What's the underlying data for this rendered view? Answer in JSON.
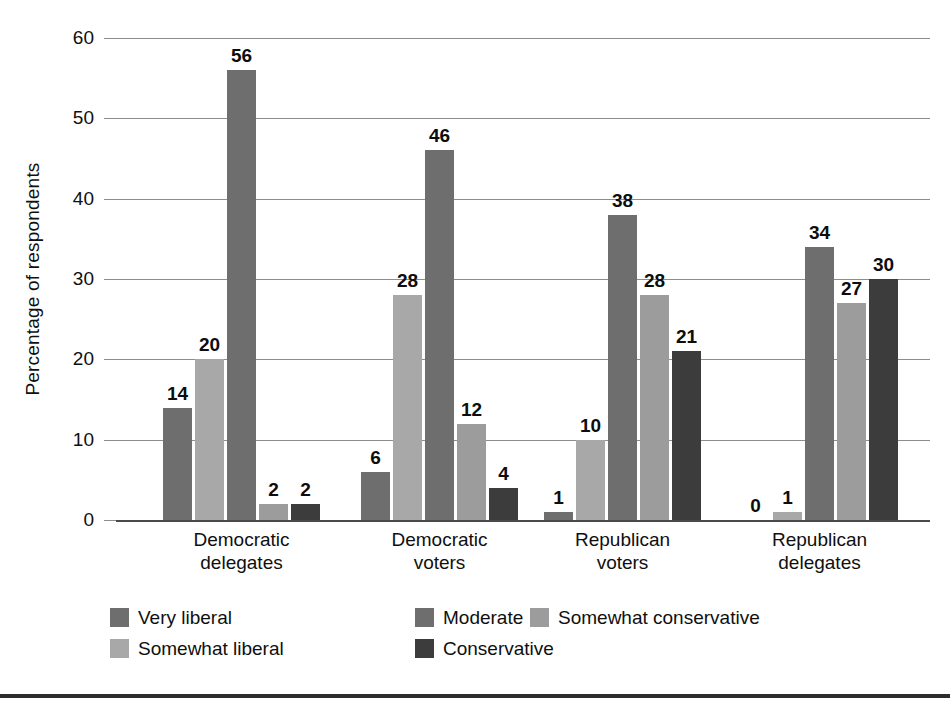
{
  "chart_data": {
    "type": "bar",
    "title": "",
    "subtitle": "",
    "xlabel": "",
    "ylabel": "Percentage of respondents",
    "ylim": [
      0,
      60
    ],
    "ytick_step": 10,
    "yticks": [
      "0",
      "10",
      "20",
      "30",
      "40",
      "50",
      "60"
    ],
    "grid": true,
    "legend_position": "bottom",
    "categories": [
      "Democratic delegates",
      "Democratic voters",
      "Republican voters",
      "Republican delegates"
    ],
    "category_lines": [
      [
        "Democratic",
        "delegates"
      ],
      [
        "Democratic",
        "voters"
      ],
      [
        "Republican",
        "voters"
      ],
      [
        "Republican",
        "delegates"
      ]
    ],
    "series": [
      {
        "name": "Very liberal",
        "color": "#6e6e6e",
        "values": [
          14,
          6,
          1,
          0
        ]
      },
      {
        "name": "Somewhat liberal",
        "color": "#a8a8a8",
        "values": [
          20,
          28,
          10,
          1
        ]
      },
      {
        "name": "Moderate",
        "color": "#6e6e6e",
        "values": [
          56,
          46,
          38,
          34
        ]
      },
      {
        "name": "Somewhat conservative",
        "color": "#9c9c9c",
        "values": [
          2,
          12,
          28,
          27
        ]
      },
      {
        "name": "Conservative",
        "color": "#3c3c3c",
        "values": [
          2,
          4,
          21,
          30
        ]
      }
    ],
    "data_labels": [
      [
        "14",
        "20",
        "56",
        "2",
        "2"
      ],
      [
        "6",
        "28",
        "46",
        "12",
        "4"
      ],
      [
        "1",
        "10",
        "38",
        "28",
        "21"
      ],
      [
        "0",
        "1",
        "34",
        "27",
        "30"
      ]
    ]
  },
  "legend": {
    "entries": [
      {
        "label": "Very liberal",
        "color": "#6e6e6e"
      },
      {
        "label": "Somewhat liberal",
        "color": "#a8a8a8"
      },
      {
        "label": "Moderate",
        "color": "#6e6e6e"
      },
      {
        "label": "Somewhat conservative",
        "color": "#9c9c9c"
      },
      {
        "label": "Conservative",
        "color": "#3c3c3c"
      }
    ]
  },
  "colors": {
    "background": "#ffffff",
    "gridline": "#8d8d8d",
    "baseline": "#4a4a4a",
    "text": "#0f0f0f",
    "bottom_rule": "#2c2c2c"
  }
}
